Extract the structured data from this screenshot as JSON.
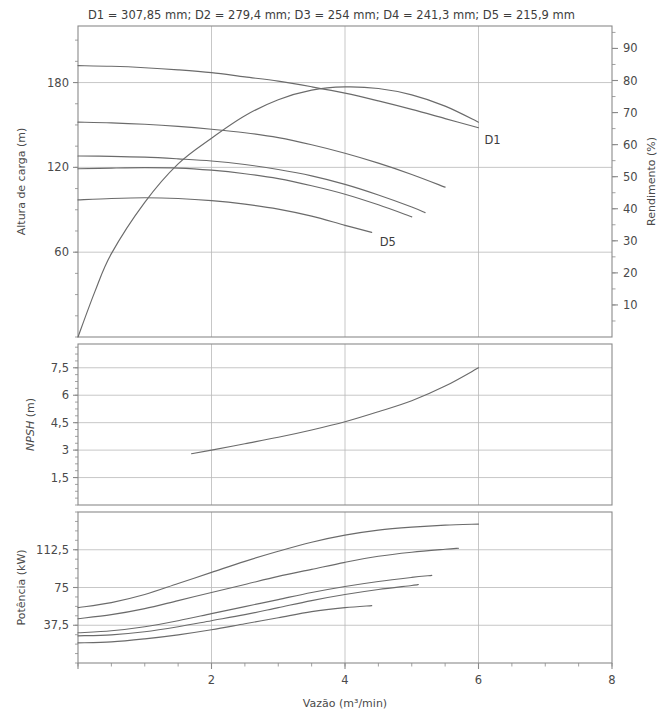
{
  "figure": {
    "note": "D1 = 307,85 mm; D2 = 279,4 mm; D3 = 254 mm; D4 = 241,3 mm; D5 = 215,9 mm",
    "background": "#ffffff",
    "curve_color": "#6b6b6b",
    "grid_color": "#b9b9b9",
    "axis_color": "#8a8a8a",
    "text_color": "#3d3d3d"
  },
  "labels": {
    "head_axis": "Altura de carga (m)",
    "efficiency_axis": "Rendimento (%)",
    "npsh_axis": "NPSH (m)",
    "npsh_axis_italic": "NPSH",
    "npsh_axis_rest": " (m)",
    "power_axis": "Potência (kW)",
    "x_axis": "Vazão (m³/min)",
    "curve_first": "D1",
    "curve_last": "D5"
  },
  "chart_data": {
    "type": "line",
    "title": "D1 = 307,85 mm; D2 = 279,4 mm; D3 = 254 mm; D4 = 241,3 mm; D5 = 215,9 mm",
    "xlabel": "Vazão (m³/min)",
    "xlim": [
      0,
      8
    ],
    "xticks": [
      0,
      2,
      4,
      6,
      8
    ],
    "xtick_labels": [
      "",
      "2",
      "4",
      "6",
      "8"
    ],
    "x_minor_step": 0.5,
    "grid": true,
    "legend": "inline curve labels D1 and D5",
    "panels": [
      {
        "name": "head-efficiency",
        "ylabel": "Altura de carga (m)",
        "ylim": [
          0,
          220
        ],
        "yticks": [
          60,
          120,
          180
        ],
        "ytick_labels": [
          "60",
          "120",
          "180"
        ],
        "y2label": "Rendimento (%)",
        "y2lim": [
          0,
          97
        ],
        "y2ticks": [
          10,
          20,
          30,
          40,
          50,
          60,
          70,
          80,
          90
        ],
        "y2tick_labels": [
          "10",
          "20",
          "30",
          "40",
          "50",
          "60",
          "70",
          "80",
          "90"
        ],
        "series": [
          {
            "name": "D1",
            "axis": "left",
            "label": "D1",
            "x": [
              0,
              0.5,
              1.0,
              1.5,
              2.0,
              2.5,
              3.0,
              3.5,
              4.0,
              4.5,
              5.0,
              5.5,
              6.0
            ],
            "y": [
              192,
              191.5,
              190.5,
              189,
              187,
              184,
              181,
              177,
              172.5,
              167,
              161,
              154.5,
              148
            ]
          },
          {
            "name": "D2",
            "axis": "left",
            "x": [
              0,
              0.5,
              1.0,
              1.5,
              2.0,
              2.5,
              3.0,
              3.5,
              4.0,
              4.5,
              5.0,
              5.5
            ],
            "y": [
              152,
              151.5,
              150.5,
              149,
              147,
              144.5,
              141,
              136,
              130,
              123,
              115,
              106
            ]
          },
          {
            "name": "D3",
            "axis": "left",
            "x": [
              0,
              0.5,
              1.0,
              1.5,
              2.0,
              2.5,
              3.0,
              3.5,
              4.0,
              4.5,
              5.0,
              5.2
            ],
            "y": [
              128,
              127.8,
              127.2,
              126,
              124.5,
              122,
              118.5,
              114,
              108,
              100.5,
              92,
              88
            ]
          },
          {
            "name": "D4",
            "axis": "left",
            "x": [
              0,
              0.5,
              1.0,
              1.5,
              2.0,
              2.5,
              3.0,
              3.5,
              4.0,
              4.5,
              5.0
            ],
            "y": [
              119,
              119.5,
              119.8,
              119.5,
              118,
              115.5,
              112,
              107,
              101,
              93.5,
              85
            ]
          },
          {
            "name": "D5",
            "axis": "left",
            "label": "D5",
            "x": [
              0,
              0.5,
              1.0,
              1.5,
              2.0,
              2.5,
              3.0,
              3.5,
              4.0,
              4.4
            ],
            "y": [
              97,
              98,
              98.5,
              98,
              96.5,
              94,
              90.5,
              85.5,
              79,
              74
            ]
          },
          {
            "name": "Rendimento",
            "axis": "right",
            "x": [
              0,
              0.25,
              0.5,
              1.0,
              1.5,
              2.0,
              2.5,
              3.0,
              3.5,
              4.0,
              4.5,
              5.0,
              5.5,
              6.0
            ],
            "y": [
              0,
              14,
              26,
              42,
              54,
              62,
              69,
              74,
              77,
              78,
              77.5,
              75.5,
              72,
              67
            ]
          }
        ]
      },
      {
        "name": "npsh",
        "ylabel": "NPSH (m)",
        "ylim": [
          0,
          8.8
        ],
        "yticks": [
          1.5,
          3,
          4.5,
          6,
          7.5
        ],
        "ytick_labels": [
          "1,5",
          "3",
          "4,5",
          "6",
          "7,5"
        ],
        "series": [
          {
            "name": "NPSH",
            "x": [
              1.7,
              2.0,
              2.5,
              3.0,
              3.5,
              4.0,
              4.5,
              5.0,
              5.5,
              6.0
            ],
            "y": [
              2.8,
              3.0,
              3.35,
              3.7,
              4.1,
              4.55,
              5.1,
              5.7,
              6.5,
              7.5
            ]
          }
        ]
      },
      {
        "name": "power",
        "ylabel": "Potência (kW)",
        "ylim": [
          0,
          150
        ],
        "yticks": [
          37.5,
          75,
          112.5
        ],
        "ytick_labels": [
          "37,5",
          "75",
          "112,5"
        ],
        "series": [
          {
            "name": "D1",
            "x": [
              0,
              0.5,
              1.0,
              1.5,
              2.0,
              2.5,
              3.0,
              3.5,
              4.0,
              4.5,
              5.0,
              5.5,
              6.0
            ],
            "y": [
              55,
              60,
              68,
              79,
              90,
              101,
              111,
              120,
              127,
              132,
              135,
              137,
              138
            ]
          },
          {
            "name": "D2",
            "x": [
              0,
              0.5,
              1.0,
              1.5,
              2.0,
              2.5,
              3.0,
              3.5,
              4.0,
              4.5,
              5.0,
              5.5,
              5.7
            ],
            "y": [
              44,
              48,
              54,
              62,
              70,
              78,
              86,
              93,
              100,
              106,
              110,
              113,
              114
            ]
          },
          {
            "name": "D3",
            "x": [
              0,
              0.5,
              1.0,
              1.5,
              2.0,
              2.5,
              3.0,
              3.5,
              4.0,
              4.5,
              5.0,
              5.3
            ],
            "y": [
              30,
              32,
              36,
              42,
              49,
              56,
              63,
              70,
              76,
              81,
              85,
              87
            ]
          },
          {
            "name": "D4",
            "x": [
              0,
              0.5,
              1.0,
              1.5,
              2.0,
              2.5,
              3.0,
              3.5,
              4.0,
              4.5,
              5.0,
              5.1
            ],
            "y": [
              27,
              28,
              31,
              36,
              42,
              48,
              55,
              62,
              68,
              73,
              77,
              78
            ]
          },
          {
            "name": "D5",
            "x": [
              0,
              0.5,
              1.0,
              1.5,
              2.0,
              2.5,
              3.0,
              3.5,
              4.0,
              4.4
            ],
            "y": [
              20,
              21,
              24,
              28,
              33,
              39,
              45,
              51,
              55,
              57
            ]
          }
        ]
      }
    ]
  }
}
